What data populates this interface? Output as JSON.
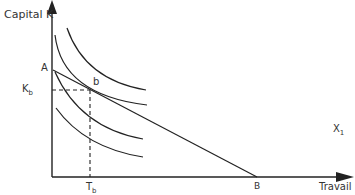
{
  "diagram": {
    "y_axis_label": "Capital K",
    "x_axis_label": "Travail",
    "point_a_label": "A",
    "point_b_label": "b",
    "point_B_label": "B",
    "kb_label_main": "K",
    "kb_label_sub": "b",
    "tb_label_main": "T",
    "tb_label_sub": "b",
    "x1_label_main": "X",
    "x1_label_sub": "1",
    "colors": {
      "line": "#222222",
      "background": "#ffffff"
    },
    "elements": {
      "isoquants": 4,
      "budget_line": {
        "from": "A",
        "to": "B"
      },
      "tangency_point": "b"
    }
  }
}
